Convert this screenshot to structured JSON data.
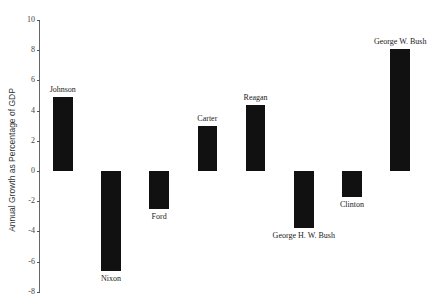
{
  "chart_data": {
    "type": "bar",
    "title": "",
    "xlabel": "",
    "ylabel": "Annual Growth as Percentage of GDP",
    "ylim": [
      -8,
      10
    ],
    "yticks": [
      10,
      8,
      6,
      4,
      2,
      0,
      -2,
      -4,
      -6,
      -8
    ],
    "grid": false,
    "legend": null,
    "categories": [
      "Johnson",
      "Nixon",
      "Ford",
      "Carter",
      "Reagan",
      "George H. W. Bush",
      "Clinton",
      "George W. Bush"
    ],
    "values": [
      4.9,
      -6.6,
      -2.5,
      3.0,
      4.4,
      -3.8,
      -1.7,
      8.1
    ],
    "bar_color": "#111111"
  }
}
